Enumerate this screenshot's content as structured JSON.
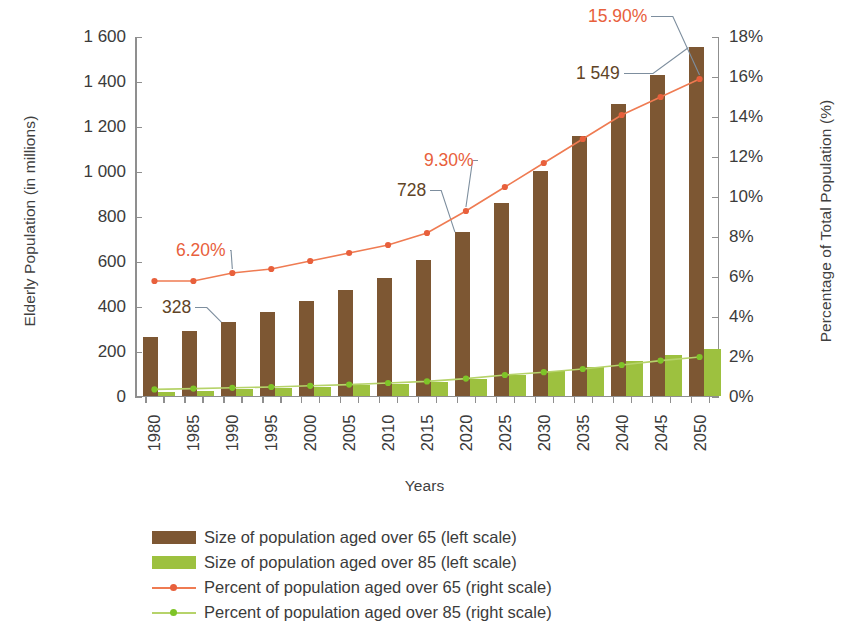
{
  "chart_data": {
    "type": "bar",
    "title": "",
    "xlabel": "Years",
    "ylabel": "Elderly Population (in millions)",
    "ylabel_right": "Percentage of Total Population (%)",
    "categories": [
      "1980",
      "1985",
      "1990",
      "1995",
      "2000",
      "2005",
      "2010",
      "2015",
      "2020",
      "2025",
      "2030",
      "2035",
      "2040",
      "2045",
      "2050"
    ],
    "ylim": [
      0,
      1600
    ],
    "ylim_right": [
      0,
      18
    ],
    "yticks": [
      "0",
      "200",
      "400",
      "600",
      "800",
      "1 000",
      "1 200",
      "1 400",
      "1 600"
    ],
    "yticks_right": [
      "0%",
      "2%",
      "4%",
      "6%",
      "8%",
      "10%",
      "12%",
      "14%",
      "16%",
      "18%"
    ],
    "grid": false,
    "legend_position": "bottom",
    "series": [
      {
        "name": "Size of population aged over 65 (left scale)",
        "type": "bar",
        "axis": "left",
        "color": "#7d5733",
        "values": [
          261,
          288,
          328,
          372,
          420,
          470,
          524,
          604,
          728,
          856,
          998,
          1152,
          1296,
          1424,
          1549
        ]
      },
      {
        "name": "Size of population aged over 85 (left scale)",
        "type": "bar",
        "axis": "left",
        "color": "#9dc13f",
        "values": [
          17,
          22,
          27,
          32,
          38,
          45,
          52,
          60,
          74,
          92,
          108,
          128,
          152,
          180,
          205
        ]
      },
      {
        "name": "Percent of population aged over 65 (right scale)",
        "type": "line",
        "axis": "right",
        "color": "#e8603c",
        "values": [
          5.8,
          5.8,
          6.2,
          6.4,
          6.8,
          7.2,
          7.6,
          8.2,
          9.3,
          10.5,
          11.7,
          12.9,
          14.1,
          15.0,
          15.9
        ]
      },
      {
        "name": "Percent of population aged over 85 (right scale)",
        "type": "line",
        "axis": "right",
        "color": "#7ec428",
        "values": [
          0.38,
          0.42,
          0.46,
          0.5,
          0.56,
          0.62,
          0.7,
          0.78,
          0.92,
          1.1,
          1.24,
          1.4,
          1.6,
          1.82,
          2.0
        ]
      }
    ],
    "annotations": [
      {
        "text": "6.20%",
        "kind": "percent",
        "series": "Percent of population aged over 65 (right scale)",
        "category": "1990",
        "value": 6.2
      },
      {
        "text": "9.30%",
        "kind": "percent",
        "series": "Percent of population aged over 65 (right scale)",
        "category": "2020",
        "value": 9.3
      },
      {
        "text": "15.90%",
        "kind": "percent",
        "series": "Percent of population aged over 65 (right scale)",
        "category": "2050",
        "value": 15.9
      },
      {
        "text": "328",
        "kind": "value",
        "series": "Size of population aged over 65 (left scale)",
        "category": "1990",
        "value": 328
      },
      {
        "text": "728",
        "kind": "value",
        "series": "Size of population aged over 65 (left scale)",
        "category": "2020",
        "value": 728
      },
      {
        "text": "1 549",
        "kind": "value",
        "series": "Size of population aged over 65 (left scale)",
        "category": "2050",
        "value": 1549
      }
    ],
    "colors": {
      "bar_over65": "#7d5733",
      "bar_over85": "#9dc13f",
      "line_over65": "#e8603c",
      "line_over85": "#7ec428",
      "axis": "#8f8f8f",
      "text": "#3b3b3b",
      "annotation_value": "#5f4426",
      "leader": "#7d8e9e"
    }
  },
  "legend": {
    "items": [
      {
        "label": "Size of population aged over 65 (left scale)",
        "marker": "swatch",
        "color": "#7d5733"
      },
      {
        "label": "Size of population aged over 85 (left scale)",
        "marker": "swatch",
        "color": "#9dc13f"
      },
      {
        "label": "Percent of population aged over 65 (right scale)",
        "marker": "line",
        "color": "#e8603c"
      },
      {
        "label": "Percent of population aged over 85 (right scale)",
        "marker": "line",
        "color": "#7ec428"
      }
    ]
  }
}
